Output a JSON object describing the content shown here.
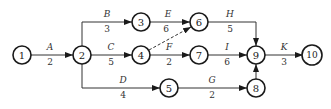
{
  "diagram": {
    "type": "activity-on-arrow network",
    "nodes": [
      {
        "id": "1",
        "x": 22,
        "y": 55
      },
      {
        "id": "2",
        "x": 82,
        "y": 55
      },
      {
        "id": "3",
        "x": 141,
        "y": 22
      },
      {
        "id": "4",
        "x": 141,
        "y": 55
      },
      {
        "id": "5",
        "x": 169,
        "y": 88
      },
      {
        "id": "6",
        "x": 199,
        "y": 22
      },
      {
        "id": "7",
        "x": 199,
        "y": 55
      },
      {
        "id": "8",
        "x": 256,
        "y": 88
      },
      {
        "id": "9",
        "x": 256,
        "y": 55
      },
      {
        "id": "10",
        "x": 312,
        "y": 55
      }
    ],
    "activities": [
      {
        "name": "A",
        "duration": "2",
        "from": "1",
        "to": "2"
      },
      {
        "name": "B",
        "duration": "3",
        "from": "2",
        "to": "3"
      },
      {
        "name": "C",
        "duration": "5",
        "from": "2",
        "to": "4"
      },
      {
        "name": "D",
        "duration": "4",
        "from": "2",
        "to": "5"
      },
      {
        "name": "E",
        "duration": "6",
        "from": "3",
        "to": "6"
      },
      {
        "name": "F",
        "duration": "2",
        "from": "4",
        "to": "7"
      },
      {
        "name": "G",
        "duration": "2",
        "from": "5",
        "to": "8"
      },
      {
        "name": "H",
        "duration": "5",
        "from": "6",
        "to": "9"
      },
      {
        "name": "I",
        "duration": "6",
        "from": "7",
        "to": "9"
      },
      {
        "name": "K",
        "duration": "3",
        "from": "9",
        "to": "10"
      }
    ],
    "dummy_activities": [
      {
        "from": "4",
        "to": "6",
        "style": "dashed"
      },
      {
        "from": "8",
        "to": "9",
        "style": "solid"
      }
    ]
  }
}
